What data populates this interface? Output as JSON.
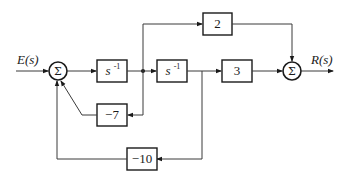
{
  "diagram": {
    "type": "block-diagram",
    "input_signal": "E(s)",
    "output_signal": "R(s)",
    "summing_junction_symbol": "Σ",
    "blocks": {
      "integrator1": {
        "base": "s",
        "exponent": "-1"
      },
      "integrator2": {
        "base": "s",
        "exponent": "-1"
      },
      "gain_forward": "3",
      "gain_feedforward": "2",
      "gain_inner_feedback": "−7",
      "gain_outer_feedback": "−10"
    },
    "connections": [
      {
        "from": "E(s)",
        "to": "sum1"
      },
      {
        "from": "sum1",
        "to": "integrator1"
      },
      {
        "from": "integrator1",
        "to": "integrator2"
      },
      {
        "from": "integrator1",
        "to": "gain_inner_feedback"
      },
      {
        "from": "integrator1",
        "to": "gain_feedforward"
      },
      {
        "from": "integrator2",
        "to": "gain_forward"
      },
      {
        "from": "integrator2",
        "to": "gain_outer_feedback"
      },
      {
        "from": "gain_inner_feedback",
        "to": "sum1"
      },
      {
        "from": "gain_outer_feedback",
        "to": "sum1"
      },
      {
        "from": "gain_forward",
        "to": "sum2"
      },
      {
        "from": "gain_feedforward",
        "to": "sum2"
      },
      {
        "from": "sum2",
        "to": "R(s)"
      }
    ]
  }
}
